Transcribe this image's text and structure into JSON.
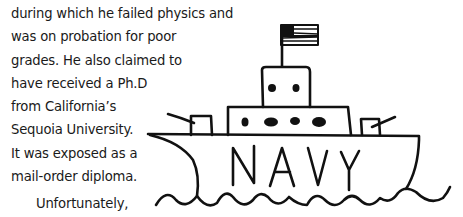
{
  "paragraph": {
    "lines": [
      "during which he failed physics and",
      "was on probation for poor",
      "grades. He also claimed to",
      "have received a Ph.D",
      "from California’s",
      "Sequoia University.",
      "It was exposed as a",
      "mail-order diploma."
    ],
    "next_paragraph_start": "Unfortunately,"
  },
  "illustration": {
    "subject": "navy-ship-drawing",
    "hull_text": "NAVY",
    "flag": "us-flag"
  }
}
